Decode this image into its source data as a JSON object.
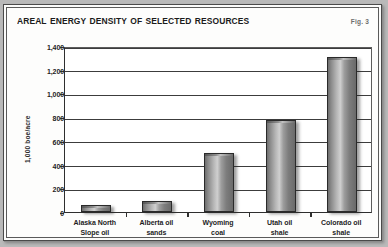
{
  "figure": {
    "title": "Areal energy density of selected resources",
    "figure_number": "Fig. 3"
  },
  "chart_data": {
    "type": "bar",
    "title": "Areal energy density of selected resources",
    "xlabel": "",
    "ylabel": "1,000 boe/acre",
    "categories": [
      "Alaska North Slope oil",
      "Alberta oil sands",
      "Wyoming coal",
      "Utah oil shale",
      "Colorado oil shale"
    ],
    "category_lines": [
      [
        "Alaska North",
        "Slope oil"
      ],
      [
        "Alberta oil",
        "sands"
      ],
      [
        "Wyoming",
        "coal"
      ],
      [
        "Utah oil",
        "shale"
      ],
      [
        "Colorado oil",
        "shale"
      ]
    ],
    "values": [
      60,
      90,
      500,
      780,
      1310
    ],
    "ylim": [
      0,
      1400
    ],
    "yticks": [
      0,
      200,
      400,
      600,
      800,
      1000,
      1200,
      1400
    ],
    "ytick_labels": [
      "0",
      "200",
      "400",
      "600",
      "800",
      "1,000",
      "1,200",
      "1,400"
    ],
    "grid": true,
    "legend": "none",
    "bar_color": "#a8a8a8",
    "bar_edge_color": "#2a2a2a"
  }
}
